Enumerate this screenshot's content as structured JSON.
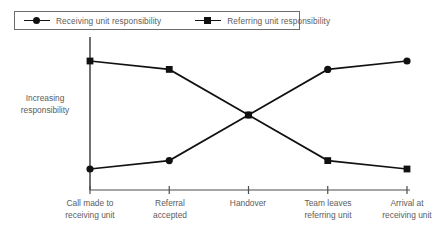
{
  "chart_data": {
    "type": "line",
    "title": "",
    "subtitle": "",
    "xlabel": "",
    "ylabel": "Increasing responsibility",
    "categories": [
      "Call made to receiving unit",
      "Referral accepted",
      "Handover",
      "Team leaves referring unit",
      "Arrival at receiving unit"
    ],
    "series": [
      {
        "name": "Receiving unit responsibility",
        "marker": "circle",
        "color": "#111111",
        "values": [
          5,
          12,
          50,
          88,
          95
        ]
      },
      {
        "name": "Referring unit responsibility",
        "marker": "square",
        "color": "#111111",
        "values": [
          95,
          88,
          50,
          12,
          5
        ]
      }
    ],
    "ylim": [
      0,
      100
    ],
    "grid": false,
    "legend_position": "top-left",
    "y_axis_ticks_shown": false,
    "x_axis_ticks_shown": true,
    "annotation": "The two series cross at the Handover stage, where responsibility is equally shared."
  },
  "legend": {
    "entries": [
      {
        "label": "Receiving unit responsibility",
        "marker": "circle"
      },
      {
        "label": "Referring unit responsibility",
        "marker": "square"
      }
    ]
  },
  "axes": {
    "y_caption_line1": "Increasing",
    "y_caption_line2": "responsibility"
  },
  "x_labels": [
    {
      "line1": "Call made to",
      "line2": "receiving unit"
    },
    {
      "line1": "Referral",
      "line2": "accepted"
    },
    {
      "line1": "Handover",
      "line2": ""
    },
    {
      "line1": "Team leaves",
      "line2": "referring unit"
    },
    {
      "line1": "Arrival at",
      "line2": "receiving unit"
    }
  ],
  "colors": {
    "line": "#111111",
    "axis": "#4d4d4d",
    "text": "#5c5c5c",
    "legend_border": "#6d6d6d",
    "background": "#ffffff"
  }
}
